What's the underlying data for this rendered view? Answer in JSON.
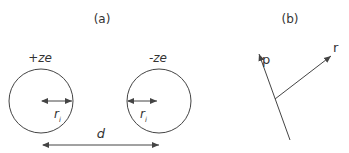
{
  "panels": {
    "a": {
      "label": "(a)",
      "left_charge": "+ze",
      "right_charge": "-ze",
      "radius_label": "r",
      "radius_subscript": "i",
      "distance_label": "d"
    },
    "b": {
      "label": "(b)",
      "vector_p": "p",
      "vector_r": "r"
    }
  },
  "colors": {
    "stroke": "#444444",
    "text": "#333333",
    "background": "#ffffff"
  }
}
